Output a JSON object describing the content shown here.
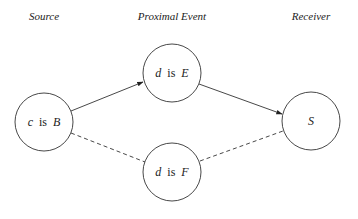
{
  "headers": {
    "source": "Source",
    "proximal": "Proximal Event",
    "receiver": "Receiver"
  },
  "nodes": {
    "cB": {
      "var": "c",
      "is": "is",
      "pred": "B"
    },
    "dE": {
      "var": "d",
      "is": "is",
      "pred": "E"
    },
    "dF": {
      "var": "d",
      "is": "is",
      "pred": "F"
    },
    "S": {
      "pred": "S"
    }
  },
  "edges": [
    {
      "from": "cB",
      "to": "dE",
      "style": "solid",
      "arrow": true
    },
    {
      "from": "dE",
      "to": "S",
      "style": "solid",
      "arrow": true
    },
    {
      "from": "cB",
      "to": "dF",
      "style": "dashed",
      "arrow": false
    },
    {
      "from": "dF",
      "to": "S",
      "style": "dashed",
      "arrow": false
    }
  ]
}
